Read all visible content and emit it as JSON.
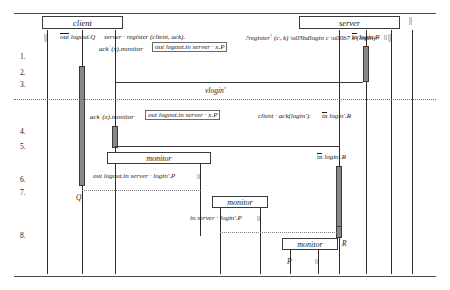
{
  "diagram": {
    "kind": "sequence-diagram",
    "participants": [
      {
        "id": "client",
        "label": "client"
      },
      {
        "id": "server",
        "label": "server"
      }
    ],
    "row_labels": [
      "1.",
      "2.",
      "3.",
      "4.",
      "5.",
      "6.",
      "7.",
      "8."
    ],
    "restriction_line_label": "νlogin'",
    "monitor_boxes": [
      {
        "id": "monitor-mid",
        "label": "monitor"
      },
      {
        "id": "monitor-lower",
        "label": "monitor"
      },
      {
        "id": "monitor-bottom",
        "label": "monitor"
      }
    ],
    "terms": {
      "client_out_logout": "out logout.Q",
      "client_register": "server · register (client, ack).",
      "client_ack_monitor": "ack⁺(x).monitor",
      "client_boxed_term": "out logout.in server · x.P",
      "server_register_recv": "?register† (c, k) νlogin c · k (login).",
      "server_in_login_R": "in login.R",
      "client_ack_monitor_2": "ack⁺(x).monitor",
      "client_boxed_term_2": "out logout.in server · x.P",
      "server_client_ack": "client · ack(login').",
      "server_in_loginp_R_inline": "in login'.R",
      "server_in_loginp_R": "in login'.R",
      "client_continuation": "out logout.in server · login'.P",
      "client_in_server": "in server · login'.P"
    },
    "labels": {
      "par_top_left": "||",
      "par_top_right": "||",
      "par_far_right": "||",
      "par_after_server_term": "||",
      "par_row6": "||",
      "par_row8": "||",
      "par_bottom": "||",
      "Q": "Q",
      "R": "R",
      "P": "P"
    },
    "colors": {
      "ink": "#1a1a1a",
      "line": "#3a3a3a",
      "activation_fill": "#888888",
      "box_border": "#3b3b3b",
      "dotted": "#7a7a7a"
    }
  }
}
